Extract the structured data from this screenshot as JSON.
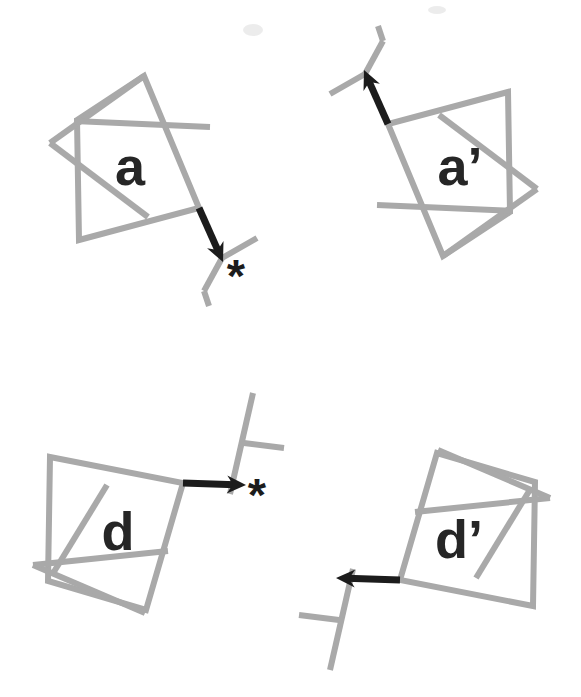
{
  "figure": {
    "width": 581,
    "height": 697,
    "background": "#ffffff",
    "line_color": "#a9a9a9",
    "arrow_color": "#1c1c1c",
    "label_color": "#262626",
    "line_width": 6,
    "arrow_shaft_width": 7,
    "smudges": [
      {
        "cx": 253,
        "cy": 30,
        "rx": 10,
        "ry": 6
      },
      {
        "cx": 437,
        "cy": 10,
        "rx": 9,
        "ry": 4
      }
    ],
    "panels": [
      {
        "id": "a",
        "label": "a",
        "label_pos": {
          "x": 130,
          "y": 185
        },
        "asterisk": "*",
        "asterisk_pos": {
          "x": 236,
          "y": 292
        },
        "ring_polygon": [
          [
            144,
            76
          ],
          [
            77,
            120
          ],
          [
            79,
            240
          ],
          [
            199,
            208
          ]
        ],
        "ring_segments": [
          [
            144,
            76,
            50,
            143
          ],
          [
            50,
            143,
            148,
            217
          ],
          [
            74,
            121,
            210,
            127
          ]
        ],
        "branch_segments": [
          [
            222,
            258,
            257,
            238
          ],
          [
            222,
            258,
            204,
            291
          ],
          [
            204,
            291,
            209,
            306
          ]
        ],
        "arrow": {
          "x1": 199,
          "y1": 208,
          "x2": 223,
          "y2": 262
        }
      },
      {
        "id": "a-prime",
        "label": "a’",
        "label_pos": {
          "x": 460,
          "y": 185
        },
        "asterisk": null,
        "asterisk_pos": null,
        "ring_polygon": [
          [
            443,
            256
          ],
          [
            510,
            212
          ],
          [
            508,
            92
          ],
          [
            388,
            124
          ]
        ],
        "ring_segments": [
          [
            443,
            256,
            537,
            189
          ],
          [
            537,
            189,
            439,
            115
          ],
          [
            513,
            211,
            377,
            205
          ]
        ],
        "branch_segments": [
          [
            365,
            74,
            330,
            94
          ],
          [
            365,
            74,
            383,
            41
          ],
          [
            383,
            41,
            378,
            26
          ]
        ],
        "arrow": {
          "x1": 388,
          "y1": 124,
          "x2": 364,
          "y2": 70
        }
      },
      {
        "id": "d",
        "label": "d",
        "label_pos": {
          "x": 118,
          "y": 550
        },
        "asterisk": "*",
        "asterisk_pos": {
          "x": 257,
          "y": 511
        },
        "ring_polygon": [
          [
            50,
            457
          ],
          [
            183,
            483
          ],
          [
            146,
            610
          ],
          [
            48,
            581
          ]
        ],
        "ring_segments": [
          [
            33,
            565,
            145,
            613
          ],
          [
            33,
            565,
            168,
            551
          ],
          [
            52,
            575,
            107,
            485
          ]
        ],
        "branch_segments": [
          [
            253,
            393,
            230,
            494
          ],
          [
            244,
            443,
            284,
            448
          ]
        ],
        "arrow": {
          "x1": 183,
          "y1": 483,
          "x2": 246,
          "y2": 485
        }
      },
      {
        "id": "d-prime",
        "label": "d’",
        "label_pos": {
          "x": 459,
          "y": 558
        },
        "asterisk": null,
        "asterisk_pos": null,
        "ring_polygon": [
          [
            533,
            606
          ],
          [
            400,
            580
          ],
          [
            437,
            453
          ],
          [
            535,
            482
          ]
        ],
        "ring_segments": [
          [
            550,
            498,
            438,
            450
          ],
          [
            550,
            498,
            415,
            512
          ],
          [
            531,
            488,
            476,
            578
          ]
        ],
        "branch_segments": [
          [
            330,
            670,
            353,
            569
          ],
          [
            339,
            620,
            299,
            615
          ]
        ],
        "arrow": {
          "x1": 400,
          "y1": 580,
          "x2": 336,
          "y2": 578
        }
      }
    ]
  }
}
